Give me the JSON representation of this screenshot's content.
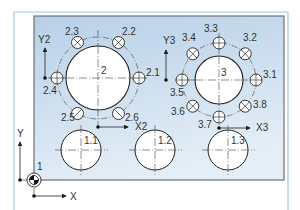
{
  "colors": {
    "panel_border": "#a9c3df",
    "plate_top": "#b9d2e8",
    "plate_bottom": "#e6f0f8",
    "plate_border": "#6b7178",
    "line": "#222222",
    "centerline": "#444444"
  },
  "origin": {
    "label": "1"
  },
  "axes": {
    "main": {
      "x_label": "X",
      "y_label": "Y"
    },
    "group2": {
      "x_label": "X2",
      "y_label": "Y2"
    },
    "group3": {
      "x_label": "X3",
      "y_label": "Y3"
    }
  },
  "group2": {
    "center_label": "2",
    "holes": [
      {
        "label": "2.1",
        "type": "plain"
      },
      {
        "label": "2.2",
        "type": "cross"
      },
      {
        "label": "2.3",
        "type": "cross"
      },
      {
        "label": "2.4",
        "type": "plain"
      },
      {
        "label": "2.5",
        "type": "cross"
      },
      {
        "label": "2.6",
        "type": "cross"
      }
    ]
  },
  "group3": {
    "center_label": "3",
    "holes": [
      {
        "label": "3.1",
        "type": "plain"
      },
      {
        "label": "3.2",
        "type": "cross"
      },
      {
        "label": "3.3",
        "type": "plain"
      },
      {
        "label": "3.4",
        "type": "cross"
      },
      {
        "label": "3.5",
        "type": "plain"
      },
      {
        "label": "3.6",
        "type": "cross"
      },
      {
        "label": "3.7",
        "type": "plain"
      },
      {
        "label": "3.8",
        "type": "cross"
      }
    ]
  },
  "row_holes": [
    {
      "label": "1.1"
    },
    {
      "label": "1.2"
    },
    {
      "label": "1.3"
    }
  ]
}
